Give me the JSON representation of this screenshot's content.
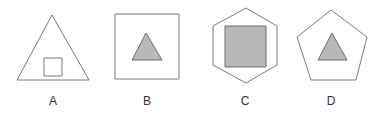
{
  "figure": {
    "stroke_color": "#7a7a7a",
    "fill_color": "#b8b8b8",
    "options": [
      {
        "label": "A",
        "outer_shape": "triangle",
        "inner_shape": "square",
        "inner_filled": false,
        "outer_points": "52,15 17,80 89,80",
        "inner_points": "44,58 62,58 62,76 44,76",
        "label_x": 53
      },
      {
        "label": "B",
        "outer_shape": "square",
        "inner_shape": "triangle",
        "inner_filled": true,
        "outer_points": "115,14 179,14 179,79 115,79",
        "inner_points": "146,33 132,60 162,60",
        "label_x": 147
      },
      {
        "label": "C",
        "outer_shape": "hexagon",
        "inner_shape": "square",
        "inner_filled": true,
        "outer_points": "246,8 277,26 277,65 246,83 213,65 213,26",
        "inner_points": "225,26 266,26 266,67 225,67",
        "label_x": 245
      },
      {
        "label": "D",
        "outer_shape": "pentagon",
        "inner_shape": "triangle",
        "inner_filled": true,
        "outer_points": "331,10 367,37 356,80 311,80 297,37",
        "inner_points": "332,33 318,60 347,60",
        "label_x": 331
      }
    ]
  }
}
